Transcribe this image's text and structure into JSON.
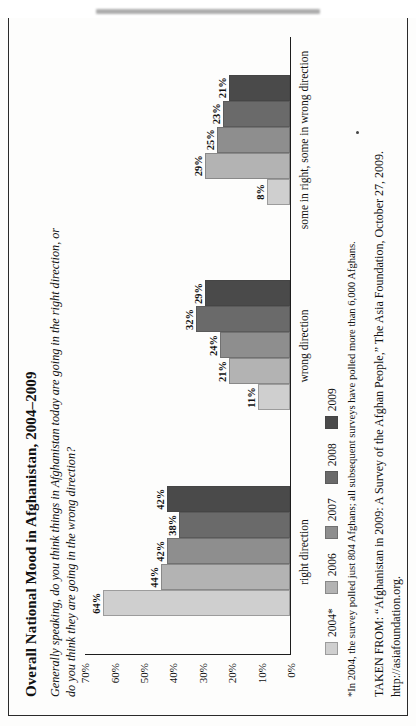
{
  "document": {
    "title": "Overall National Mood in Afghanistan, 2004–2009",
    "subtitle": "Generally speaking, do you think things in Afghanistan today are going in the right direction, or do you think they are going in the wrong direction?",
    "footnote": "*In 2004, the survey polled just 804 Afghans; all subsequent surveys have polled more than 6,000 Afghans.",
    "source_line1": "TAKEN FROM: “Afghanistan in 2009: A Survey of the Afghan People,” The Asia Foundation, October 27, 2009.",
    "source_line2": "http://asiafoundation.org."
  },
  "chart_data": {
    "type": "bar",
    "title": "Overall National Mood in Afghanistan, 2004–2009",
    "xlabel": "",
    "ylabel": "",
    "ylim": [
      0,
      70
    ],
    "grid": false,
    "legend_position": "bottom-left",
    "yticks": [
      "0%",
      "10%",
      "20%",
      "30%",
      "40%",
      "50%",
      "60%",
      "70%"
    ],
    "ytick_values": [
      0,
      10,
      20,
      30,
      40,
      50,
      60,
      70
    ],
    "categories": [
      "right direction",
      "wrong direction",
      "some in right, some in wrong direction"
    ],
    "series": [
      {
        "name": "2004*",
        "color": "#cfcfcf",
        "values": [
          64,
          11,
          8
        ],
        "labels": [
          "64%",
          "11%",
          "8%"
        ]
      },
      {
        "name": "2006",
        "color": "#b3b3b3",
        "values": [
          44,
          21,
          29
        ],
        "labels": [
          "44%",
          "21%",
          "29%"
        ]
      },
      {
        "name": "2007",
        "color": "#8e8e8e",
        "values": [
          42,
          24,
          25
        ],
        "labels": [
          "42%",
          "24%",
          "25%"
        ]
      },
      {
        "name": "2008",
        "color": "#6a6a6a",
        "values": [
          38,
          32,
          23
        ],
        "labels": [
          "38%",
          "32%",
          "23%"
        ]
      },
      {
        "name": "2009",
        "color": "#4a4a4a",
        "values": [
          42,
          29,
          21
        ],
        "labels": [
          "42%",
          "29%",
          "21%"
        ]
      }
    ]
  }
}
